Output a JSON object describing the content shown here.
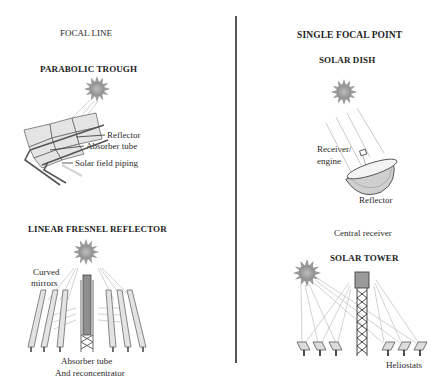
{
  "left": {
    "section_title": "FOCAL LINE",
    "parabolic_trough": {
      "title": "PARABOLIC TROUGH",
      "labels": {
        "reflector": "Reflector",
        "absorber_tube": "Absorber tube",
        "piping": "Solar field piping"
      }
    },
    "linear_fresnel": {
      "title": "LINEAR FRESNEL REFLECTOR",
      "labels": {
        "curved_mirrors_1": "Curved",
        "curved_mirrors_2": "mirrors",
        "absorber_1": "Absorber tube",
        "absorber_2": "And reconcentrator"
      }
    }
  },
  "right": {
    "section_title": "SINGLE FOCAL POINT",
    "solar_dish": {
      "title": "SOLAR DISH",
      "labels": {
        "receiver_1": "Receiver/",
        "receiver_2": "engine",
        "reflector": "Reflector"
      }
    },
    "solar_tower": {
      "pre_label": "Central receiver",
      "title": "SOLAR TOWER",
      "labels": {
        "heliostats": "Heliostats"
      }
    }
  },
  "colors": {
    "sun": "#9a9a9a",
    "mirror_fill": "#e2e2e2",
    "line": "#555555",
    "ray": "#b8b8b8",
    "divider": "#555555"
  }
}
